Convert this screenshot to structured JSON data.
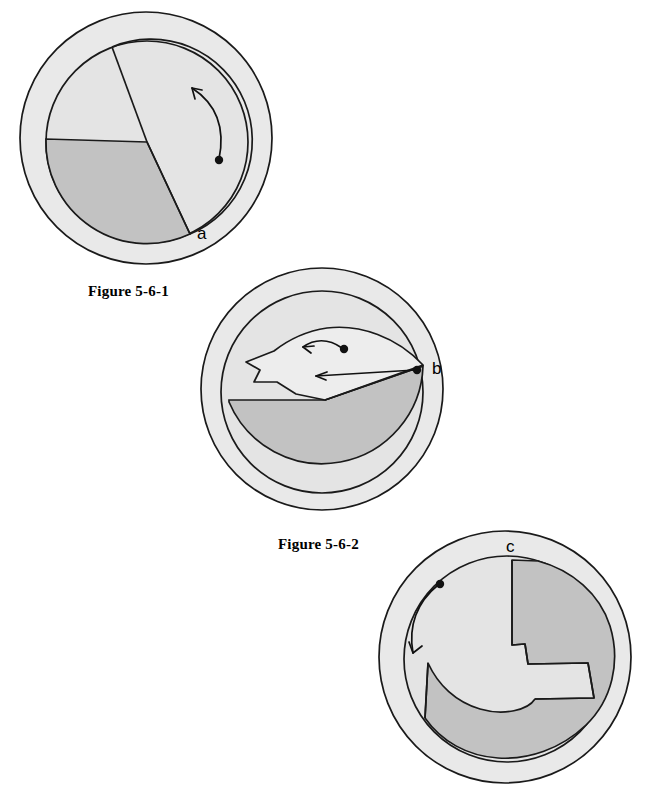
{
  "page": {
    "title": "Figure 5-6",
    "width": 658,
    "height": 796,
    "background": "#ffffff"
  },
  "palette": {
    "outer_ring_fill": "#e9e9e9",
    "inner_disc_fill": "#e4e4e4",
    "dark_wedge_fill": "#c2c2c2",
    "flap_fill": "#eeeeee",
    "stroke": "#1a1a1a",
    "ink": "#111111"
  },
  "figures": [
    {
      "id": "figure-1",
      "caption": "Figure 5-6-1",
      "label": "a",
      "label_position": "lower-right rim of inner disc",
      "rotation_arrow": {
        "direction": "counterclockwise",
        "sense": "arc arrow sweeping upward along right side",
        "dot_marker": true
      },
      "description": "Disc with a radial cut at point a and a shaded wedge occupying the lower-left third"
    },
    {
      "id": "figure-2",
      "caption": "Figure 5-6-2",
      "label": "b",
      "label_position": "right rim of inner disc",
      "rotation_arrow": {
        "direction": "leftward",
        "sense": "two straight arrows pointing left",
        "dot_marker": true,
        "count": 2
      },
      "description": "Disc with upper flap peeled back to the left, exposing shaded lower hemisphere, hinge at b"
    },
    {
      "id": "figure-3",
      "caption": "",
      "label": "c",
      "label_position": "top rim of inner disc",
      "rotation_arrow": {
        "direction": "clockwise-down",
        "sense": "arc arrow sweeping down and to the left",
        "dot_marker": true
      },
      "description": "Disc with a spiral shaded band wound from c around toward the lower left"
    }
  ],
  "captions": {
    "fig1": "Figure 5-6-1",
    "fig2": "Figure 5-6-2"
  },
  "labels": {
    "a": "a",
    "b": "b",
    "c": "c"
  }
}
